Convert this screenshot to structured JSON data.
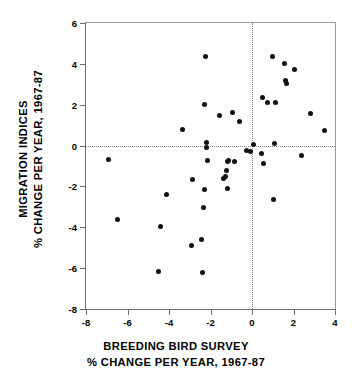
{
  "chart_data": {
    "type": "scatter",
    "title": "",
    "xlabel": "BREEDING BIRD SURVEY % CHANGE PER YEAR, 1967-87",
    "ylabel": "MIGRATION INDICES % CHANGE PER YEAR, 1967-87",
    "xlim": [
      -8,
      4
    ],
    "ylim": [
      -8,
      6
    ],
    "xticks": [
      -8,
      -6,
      -4,
      -2,
      0,
      2,
      4
    ],
    "yticks": [
      6,
      4,
      2,
      0,
      -2,
      -4,
      -6,
      -8
    ],
    "xtick_labels": [
      "-8",
      "-6",
      "-4",
      "-2",
      "0",
      "2",
      "4"
    ],
    "ytick_labels": [
      "6",
      "4",
      "2",
      "0",
      "-2",
      "-4",
      "-6",
      "-8"
    ],
    "grid": false,
    "reference_lines": {
      "vertical_x": 0,
      "horizontal_y": 0,
      "style": "dotted"
    },
    "legend": "none",
    "marker": {
      "shape": "circle",
      "color": "#111111",
      "size": 5
    },
    "points": [
      [
        -6.9,
        -0.7
      ],
      [
        -6.5,
        -3.6
      ],
      [
        -4.5,
        -6.15
      ],
      [
        -4.1,
        -2.4
      ],
      [
        -4.4,
        -3.95
      ],
      [
        -3.35,
        0.8
      ],
      [
        -2.9,
        -4.9
      ],
      [
        -2.85,
        -1.65
      ],
      [
        -2.45,
        -4.6
      ],
      [
        -2.4,
        -6.2
      ],
      [
        -2.35,
        -3.05
      ],
      [
        -2.3,
        -2.15
      ],
      [
        -2.25,
        4.35
      ],
      [
        -2.3,
        2.0
      ],
      [
        -2.2,
        0.15
      ],
      [
        -2.2,
        -0.1
      ],
      [
        -2.15,
        -0.75
      ],
      [
        -1.55,
        1.45
      ],
      [
        -1.35,
        -1.6
      ],
      [
        -1.3,
        -1.5
      ],
      [
        -1.25,
        -1.2
      ],
      [
        -1.2,
        -0.8
      ],
      [
        -1.15,
        -0.75
      ],
      [
        -1.2,
        -2.1
      ],
      [
        -0.95,
        1.6
      ],
      [
        -0.85,
        -0.8
      ],
      [
        -0.6,
        1.2
      ],
      [
        -0.25,
        -0.25
      ],
      [
        -0.05,
        -0.3
      ],
      [
        0.05,
        0.05
      ],
      [
        0.45,
        -0.4
      ],
      [
        0.5,
        2.35
      ],
      [
        0.55,
        -0.9
      ],
      [
        0.75,
        2.1
      ],
      [
        1.0,
        4.35
      ],
      [
        1.05,
        -2.65
      ],
      [
        1.1,
        0.1
      ],
      [
        1.15,
        2.1
      ],
      [
        1.55,
        4.0
      ],
      [
        1.6,
        3.2
      ],
      [
        1.65,
        3.05
      ],
      [
        2.05,
        3.7
      ],
      [
        2.4,
        -0.5
      ],
      [
        2.8,
        1.55
      ],
      [
        3.5,
        0.75
      ]
    ]
  },
  "axes": {
    "y_title_line1": "MIGRATION INDICES",
    "y_title_line2": "% CHANGE PER YEAR, 1967-87",
    "x_title_line1": "BREEDING BIRD SURVEY",
    "x_title_line2": "% CHANGE PER YEAR, 1967-87"
  }
}
